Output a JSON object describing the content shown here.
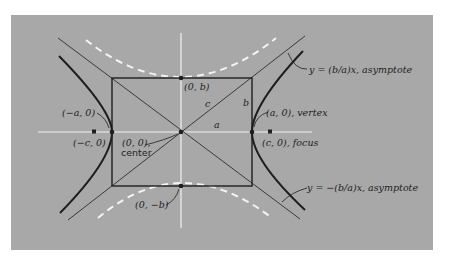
{
  "diagram": {
    "type": "hyperbola-anatomy",
    "colors": {
      "background": "#ffffff",
      "panel": "#a8a8a8",
      "curve": "#1e1e1e",
      "axes": "#f2f2f2",
      "conjugate_dashed": "#f4f4f4",
      "text": "#1e1e1e"
    },
    "labels": {
      "top_point": "(0, b)",
      "bottom_point": "(0, −b)",
      "left_vertex": "(−a, 0)",
      "left_focus": "(−c, 0)",
      "center_l1": "(0, 0),",
      "center_l2": "center",
      "right_vertex": "(a, 0), vertex",
      "right_focus": "(c, 0), focus",
      "asymptote_pos": "y = (b/a)x, asymptote",
      "asymptote_neg": "y = −(b/a)x, asymptote",
      "seg_a": "a",
      "seg_b": "b",
      "seg_c": "c"
    }
  }
}
